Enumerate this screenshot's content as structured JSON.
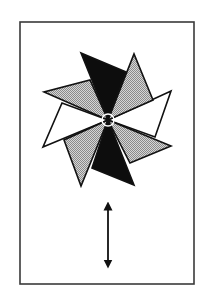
{
  "figure": {
    "width": 208,
    "height": 306,
    "background": "#ffffff",
    "frame": {
      "x": 20,
      "y": 22,
      "width": 174,
      "height": 262,
      "stroke": "#3a3a3a",
      "stroke_width": 1.6
    },
    "pinwheel": {
      "center": [
        108,
        120
      ],
      "hub_radius": 6,
      "stroke": "#111111",
      "stroke_width": 1.6,
      "colors": {
        "black": "#0d0d0d",
        "gray": "#b9b9b9",
        "white": "#ffffff"
      },
      "blades": [
        {
          "name": "blade-gray-left-upper",
          "fill": "gray",
          "points": [
            [
              108,
              120
            ],
            [
              44,
              92
            ],
            [
              90,
              80
            ]
          ]
        },
        {
          "name": "blade-white-left",
          "fill": "white",
          "points": [
            [
              108,
              120
            ],
            [
              62,
              103
            ],
            [
              43,
              147
            ]
          ]
        },
        {
          "name": "blade-gray-bottom-left",
          "fill": "gray",
          "points": [
            [
              108,
              120
            ],
            [
              64,
              140
            ],
            [
              81,
              186
            ]
          ]
        },
        {
          "name": "blade-white-right",
          "fill": "white",
          "points": [
            [
              108,
              120
            ],
            [
              171,
              91
            ],
            [
              155,
              137
            ]
          ]
        },
        {
          "name": "blade-gray-top-right",
          "fill": "gray",
          "points": [
            [
              108,
              120
            ],
            [
              134,
              54
            ],
            [
              153,
              100
            ]
          ]
        },
        {
          "name": "blade-gray-right-lower",
          "fill": "gray",
          "points": [
            [
              108,
              120
            ],
            [
              171,
              146
            ],
            [
              130,
              163
            ]
          ]
        },
        {
          "name": "blade-black-top",
          "fill": "black",
          "points": [
            [
              108,
              120
            ],
            [
              81,
              53
            ],
            [
              126,
              72
            ]
          ]
        },
        {
          "name": "blade-black-bottom",
          "fill": "black",
          "points": [
            [
              108,
              120
            ],
            [
              134,
              185
            ],
            [
              92,
              168
            ]
          ]
        }
      ]
    },
    "arrow": {
      "x": 108,
      "y1": 202,
      "y2": 268,
      "stroke": "#111111",
      "stroke_width": 1.8,
      "direction": "double-headed-vertical"
    }
  }
}
